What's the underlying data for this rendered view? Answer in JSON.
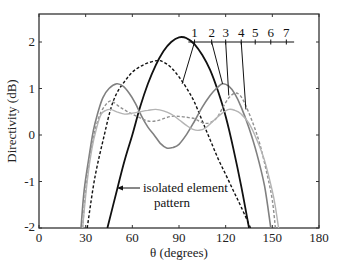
{
  "chart_data": {
    "type": "line",
    "title": "",
    "xlabel": "θ (degrees)",
    "ylabel": "Directivity (dB)",
    "xlim": [
      0,
      180
    ],
    "ylim": [
      -2,
      2.6
    ],
    "xticks": [
      0,
      30,
      60,
      90,
      120,
      150,
      180
    ],
    "yticks": [
      -2,
      -1,
      0,
      1,
      2
    ],
    "xtick_labels": [
      "0",
      "30",
      "60",
      "90",
      "120",
      "150",
      "180"
    ],
    "ytick_labels": [
      "-2",
      "-1",
      "0",
      "1",
      "2"
    ],
    "grid": false,
    "legend": {
      "position": "top-right",
      "entries": [
        "1",
        "2",
        "3",
        "4",
        "5",
        "6",
        "7"
      ]
    },
    "annotations": [
      {
        "text_lines": [
          "isolated element",
          "pattern"
        ],
        "points_to": "isolated element pattern curve at θ≈51"
      }
    ],
    "series": [
      {
        "name": "isolated element pattern",
        "style": "solid",
        "color": "#111111",
        "width": 1.8,
        "points": [
          [
            44,
            -2
          ],
          [
            50,
            -1.2
          ],
          [
            55,
            -0.55
          ],
          [
            60,
            0
          ],
          [
            65,
            0.6
          ],
          [
            70,
            1.1
          ],
          [
            75,
            1.5
          ],
          [
            80,
            1.8
          ],
          [
            85,
            2.0
          ],
          [
            90,
            2.1
          ],
          [
            95,
            2.08
          ],
          [
            100,
            1.95
          ],
          [
            105,
            1.72
          ],
          [
            110,
            1.4
          ],
          [
            115,
            0.95
          ],
          [
            120,
            0.4
          ],
          [
            125,
            -0.3
          ],
          [
            130,
            -1.1
          ],
          [
            135,
            -2
          ]
        ]
      },
      {
        "name": "1",
        "style": "dashed",
        "color": "#111111",
        "width": 1.4,
        "points": [
          [
            31,
            -2
          ],
          [
            36,
            -0.9
          ],
          [
            42,
            0
          ],
          [
            46,
            0.55
          ],
          [
            50,
            0.9
          ],
          [
            55,
            1.15
          ],
          [
            60,
            1.35
          ],
          [
            65,
            1.47
          ],
          [
            70,
            1.55
          ],
          [
            76,
            1.6
          ],
          [
            80,
            1.57
          ],
          [
            85,
            1.45
          ],
          [
            90,
            1.25
          ],
          [
            95,
            1.0
          ],
          [
            100,
            0.7
          ],
          [
            105,
            0.3
          ],
          [
            110,
            -0.1
          ],
          [
            115,
            -0.5
          ],
          [
            120,
            -0.85
          ],
          [
            125,
            -1.2
          ],
          [
            130,
            -1.55
          ],
          [
            136,
            -2
          ]
        ]
      },
      {
        "name": "2",
        "style": "solid",
        "color": "#808080",
        "width": 1.6,
        "points": [
          [
            27,
            -2
          ],
          [
            29,
            -1.2
          ],
          [
            32,
            -0.5
          ],
          [
            35,
            0.1
          ],
          [
            38,
            0.5
          ],
          [
            41,
            0.8
          ],
          [
            45,
            1.0
          ],
          [
            50,
            1.1
          ],
          [
            54,
            1.05
          ],
          [
            58,
            0.9
          ],
          [
            62,
            0.68
          ],
          [
            66,
            0.4
          ],
          [
            70,
            0.17
          ],
          [
            74,
            0.0
          ],
          [
            78,
            -0.18
          ],
          [
            82,
            -0.28
          ],
          [
            86,
            -0.27
          ],
          [
            90,
            -0.2
          ],
          [
            95,
            0.02
          ],
          [
            100,
            0.3
          ],
          [
            105,
            0.6
          ],
          [
            110,
            0.85
          ],
          [
            114,
            1.0
          ],
          [
            118,
            1.1
          ],
          [
            122,
            1.05
          ],
          [
            126,
            0.88
          ],
          [
            130,
            0.6
          ],
          [
            135,
            0.15
          ],
          [
            140,
            -0.4
          ],
          [
            145,
            -1.1
          ],
          [
            149,
            -2
          ]
        ]
      },
      {
        "name": "3",
        "style": "dashed",
        "color": "#909090",
        "width": 1.4,
        "points": [
          [
            28,
            -2
          ],
          [
            30,
            -1.2
          ],
          [
            33,
            -0.4
          ],
          [
            36,
            0.1
          ],
          [
            40,
            0.5
          ],
          [
            45,
            0.72
          ],
          [
            48,
            0.7
          ],
          [
            52,
            0.6
          ],
          [
            56,
            0.52
          ],
          [
            60,
            0.45
          ],
          [
            65,
            0.37
          ],
          [
            70,
            0.3
          ],
          [
            75,
            0.3
          ],
          [
            80,
            0.35
          ],
          [
            85,
            0.4
          ],
          [
            90,
            0.4
          ],
          [
            95,
            0.38
          ],
          [
            100,
            0.35
          ],
          [
            104,
            0.28
          ],
          [
            108,
            0.25
          ],
          [
            112,
            0.3
          ],
          [
            115,
            0.4
          ],
          [
            118,
            0.58
          ],
          [
            122,
            0.8
          ],
          [
            126,
            0.9
          ],
          [
            129,
            0.86
          ],
          [
            132,
            0.7
          ],
          [
            137,
            0.3
          ],
          [
            142,
            -0.2
          ],
          [
            147,
            -0.9
          ],
          [
            150,
            -1.4
          ],
          [
            152,
            -2
          ]
        ]
      },
      {
        "name": "4",
        "style": "solid",
        "color": "#b4b4b4",
        "width": 1.4,
        "points": [
          [
            28,
            -2
          ],
          [
            31,
            -1.0
          ],
          [
            34,
            -0.3
          ],
          [
            37,
            0.15
          ],
          [
            40,
            0.45
          ],
          [
            43,
            0.53
          ],
          [
            46,
            0.55
          ],
          [
            50,
            0.5
          ],
          [
            55,
            0.45
          ],
          [
            60,
            0.47
          ],
          [
            65,
            0.5
          ],
          [
            70,
            0.53
          ],
          [
            75,
            0.55
          ],
          [
            80,
            0.52
          ],
          [
            85,
            0.45
          ],
          [
            90,
            0.33
          ],
          [
            95,
            0.2
          ],
          [
            99,
            0.12
          ],
          [
            103,
            0.1
          ],
          [
            107,
            0.15
          ],
          [
            112,
            0.3
          ],
          [
            117,
            0.45
          ],
          [
            122,
            0.55
          ],
          [
            126,
            0.53
          ],
          [
            130,
            0.45
          ],
          [
            135,
            0.25
          ],
          [
            140,
            -0.1
          ],
          [
            145,
            -0.55
          ],
          [
            150,
            -1.2
          ],
          [
            152,
            -1.55
          ],
          [
            154,
            -2
          ]
        ]
      }
    ],
    "label_ticks_row": {
      "y_value": 2.0,
      "labels": [
        {
          "text": "1",
          "x_deg": 100,
          "points_to": [
            92,
            1.1
          ]
        },
        {
          "text": "2",
          "x_deg": 111,
          "points_to": [
            118,
            1.1
          ]
        },
        {
          "text": "3",
          "x_deg": 120,
          "points_to": [
            122,
            0.85
          ]
        },
        {
          "text": "4",
          "x_deg": 130,
          "points_to": [
            133,
            0.55
          ]
        },
        {
          "text": "5",
          "x_deg": 139
        },
        {
          "text": "6",
          "x_deg": 149
        },
        {
          "text": "7",
          "x_deg": 159
        }
      ]
    }
  },
  "labels": {
    "xlabel": "θ (degrees)",
    "ylabel": "Directivity (dB)",
    "annotation_line1": "isolated element",
    "annotation_line2": "pattern"
  }
}
